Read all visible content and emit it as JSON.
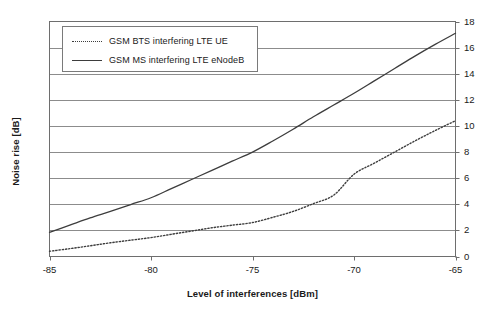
{
  "chart_data": {
    "type": "line",
    "title": "",
    "xlabel": "Level of interferences [dBm]",
    "ylabel": "Noise rise [dB]",
    "xlim": [
      -85,
      -65
    ],
    "ylim": [
      0,
      18
    ],
    "xticks": [
      -85,
      -80,
      -75,
      -70,
      -65
    ],
    "xtick_labels": [
      "-85",
      "-80",
      "-75",
      "-70",
      "-65"
    ],
    "yticks": [
      0,
      2,
      4,
      6,
      8,
      10,
      12,
      14,
      16,
      18
    ],
    "ytick_labels": [
      "0",
      "2",
      "4",
      "6",
      "8",
      "10",
      "12",
      "14",
      "16",
      "18"
    ],
    "y_axis_position": "right",
    "grid": "horizontal",
    "legend_position": "upper-left-inside",
    "x": [
      -85,
      -84,
      -83,
      -82,
      -81,
      -80,
      -79,
      -78,
      -77,
      -76,
      -75,
      -74,
      -73,
      -72,
      -71,
      -70,
      -69,
      -68,
      -67,
      -66,
      -65
    ],
    "series": [
      {
        "name": "GSM BTS interfering LTE UE",
        "style": "dotted",
        "color": "#3d3d3d",
        "values": [
          0.4,
          0.6,
          0.82,
          1.05,
          1.25,
          1.45,
          1.7,
          1.95,
          2.2,
          2.4,
          2.6,
          3.0,
          3.45,
          4.05,
          4.7,
          6.3,
          7.15,
          8.0,
          8.85,
          9.65,
          10.4
        ]
      },
      {
        "name": "GSM MS interfering LTE eNodeB",
        "style": "solid",
        "color": "#3d3d3d",
        "values": [
          1.85,
          2.4,
          2.95,
          3.45,
          3.98,
          4.5,
          5.2,
          5.9,
          6.6,
          7.3,
          8.0,
          8.85,
          9.75,
          10.7,
          11.6,
          12.5,
          13.45,
          14.4,
          15.35,
          16.25,
          17.1
        ]
      }
    ]
  },
  "legend": {
    "entries": [
      {
        "label": "GSM BTS interfering LTE UE",
        "style": "dotted"
      },
      {
        "label": "GSM MS interfering LTE eNodeB",
        "style": "solid"
      }
    ]
  },
  "axes": {
    "x_title": "Level of interferences [dBm]",
    "y_title": "Noise rise [dB]"
  },
  "colors": {
    "line": "#3d3d3d",
    "grid": "#8c8c8c",
    "frame": "#6e6e6e",
    "background": "#ffffff",
    "text": "#1a1a1a"
  }
}
